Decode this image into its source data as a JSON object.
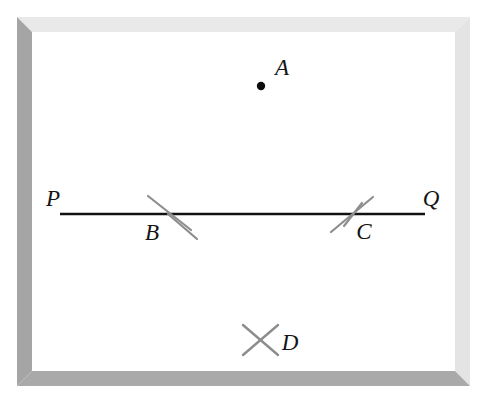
{
  "figure": {
    "canvas": {
      "width": 487,
      "height": 404,
      "background": "#ffffff"
    },
    "frame": {
      "name": "beveled-picture-frame",
      "outer": {
        "x": 17,
        "y": 17,
        "width": 453,
        "height": 369
      },
      "thickness": 15,
      "color_top": "#e9e9e9",
      "color_right": "#e4e4e4",
      "color_bottom": "#a9a9a9",
      "color_left": "#a5a5a5",
      "interior_color": "#ffffff"
    },
    "stroke_colors": {
      "line": "#111111",
      "mark": "#8d8d8d",
      "point": "#0d0d0d",
      "label": "#141414"
    },
    "points": [
      {
        "id": "A",
        "label": "A",
        "kind": "dot",
        "x": 261,
        "y": 86,
        "radius": 4.2,
        "label_x": 275,
        "label_y": 75,
        "label_size": 23
      }
    ],
    "segments": [
      {
        "id": "PQ",
        "kind": "line",
        "x1": 60,
        "y1": 214,
        "x2": 425,
        "y2": 214,
        "width": 2.4,
        "endpoint_labels": [
          {
            "id": "P",
            "label": "P",
            "x": 53,
            "y": 206,
            "size": 23
          },
          {
            "id": "Q",
            "label": "Q",
            "x": 428,
            "y": 206,
            "size": 23
          }
        ]
      }
    ],
    "marks": [
      {
        "id": "B",
        "label": "B",
        "kind": "arc-cross-on-line",
        "center_x": 168,
        "center_y": 214,
        "strokes": [
          {
            "x1": 148,
            "y1": 196,
            "x2": 191,
            "y2": 230
          },
          {
            "x1": 168,
            "y1": 214,
            "x2": 197,
            "y2": 239
          }
        ],
        "width": 2.2,
        "label_x": 145,
        "label_y": 240,
        "label_size": 23
      },
      {
        "id": "C",
        "label": "C",
        "kind": "arc-cross-on-line",
        "center_x": 353,
        "center_y": 214,
        "strokes": [
          {
            "x1": 331,
            "y1": 232,
            "x2": 373,
            "y2": 197
          },
          {
            "x1": 344,
            "y1": 226,
            "x2": 362,
            "y2": 203
          }
        ],
        "width": 2.2,
        "label_x": 356,
        "label_y": 239,
        "label_size": 23
      },
      {
        "id": "D",
        "label": "D",
        "kind": "x-cross",
        "center_x": 260,
        "center_y": 340,
        "strokes": [
          {
            "x1": 243,
            "y1": 325,
            "x2": 278,
            "y2": 355
          },
          {
            "x1": 278,
            "y1": 325,
            "x2": 243,
            "y2": 355
          }
        ],
        "width": 2.4,
        "label_x": 282,
        "label_y": 350,
        "label_size": 23
      }
    ]
  }
}
